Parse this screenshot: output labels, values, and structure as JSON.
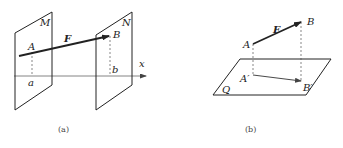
{
  "figure_a": {
    "caption": "(a)",
    "plane_left_label": "M",
    "plane_right_label": "N",
    "point_A": "A",
    "point_B": "B",
    "proj_a": "a",
    "proj_b": "b",
    "vector_label": "F",
    "axis_label": "x"
  },
  "figure_b": {
    "caption": "(b)",
    "plane_label": "Q",
    "point_A": "A",
    "point_B": "B",
    "proj_A": "A′",
    "proj_B": "B′",
    "vector_label": "F"
  },
  "colors": {
    "line": "#222222",
    "dashed": "#555555",
    "axis": "#666666"
  }
}
